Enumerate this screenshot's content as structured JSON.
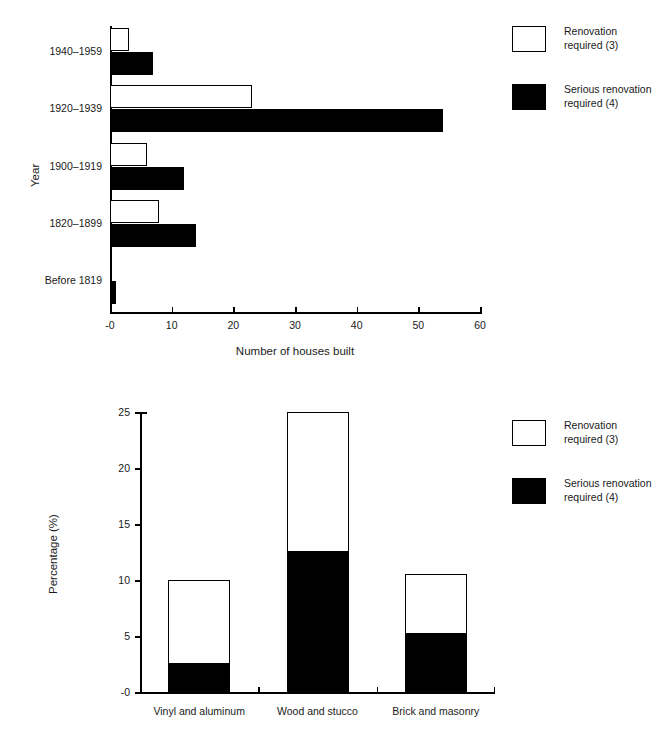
{
  "chart_data": [
    {
      "type": "bar",
      "orientation": "horizontal",
      "grouping": "grouped",
      "title": "",
      "xlabel": "Number of houses built",
      "ylabel": "Year",
      "xlim": [
        0,
        60
      ],
      "xticks": [
        "-0",
        "10",
        "20",
        "30",
        "40",
        "50",
        "60"
      ],
      "xtick_values": [
        0,
        10,
        20,
        30,
        40,
        50,
        60
      ],
      "grid": false,
      "categories": [
        "1940–1959",
        "1920–1939",
        "1900–1919",
        "1820–1899",
        "Before 1819"
      ],
      "series": [
        {
          "name": "Renovation required (3)",
          "style": "open",
          "color": "#ffffff",
          "values": [
            3,
            23,
            6,
            8,
            0
          ]
        },
        {
          "name": "Serious renovation required (4)",
          "style": "filled",
          "color": "#000000",
          "values": [
            7,
            54,
            12,
            14,
            1
          ]
        }
      ],
      "legend": {
        "position": "right",
        "entries": [
          {
            "style": "open",
            "line1": "Renovation",
            "line2": "required (3)"
          },
          {
            "style": "filled",
            "line1": "Serious renovation",
            "line2": "required (4)"
          }
        ]
      }
    },
    {
      "type": "bar",
      "orientation": "vertical",
      "grouping": "stacked",
      "title": "",
      "xlabel": "",
      "ylabel": "Percentage (%)",
      "ylim": [
        0,
        25
      ],
      "yticks": [
        "-0",
        "5",
        "10",
        "15",
        "20",
        "25"
      ],
      "ytick_values": [
        0,
        5,
        10,
        15,
        20,
        25
      ],
      "grid": false,
      "categories": [
        "Vinyl and aluminum",
        "Wood and stucco",
        "Brick and masonry"
      ],
      "series": [
        {
          "name": "Serious renovation required (4)",
          "style": "filled",
          "color": "#000000",
          "values": [
            2.5,
            12.5,
            5.2
          ]
        },
        {
          "name": "Renovation required (3)",
          "style": "open",
          "color": "#ffffff",
          "values": [
            7.5,
            12.5,
            5.3
          ]
        }
      ],
      "totals": [
        10.0,
        25.0,
        10.5
      ],
      "legend": {
        "position": "right",
        "entries": [
          {
            "style": "open",
            "line1": "Renovation",
            "line2": "required (3)"
          },
          {
            "style": "filled",
            "line1": "Serious renovation",
            "line2": "required (4)"
          }
        ]
      }
    }
  ]
}
